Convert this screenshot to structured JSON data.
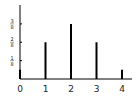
{
  "chart_data": {
    "type": "bar",
    "subtype": "stem",
    "title": "",
    "xlabel": "",
    "ylabel": "",
    "categories": [
      "0",
      "1",
      "2",
      "3",
      "4"
    ],
    "x": [
      0,
      1,
      2,
      3,
      4
    ],
    "values": [
      0.0625,
      0.25,
      0.375,
      0.25,
      0.0625
    ],
    "x_tick_labels": [
      "0",
      "1",
      "2",
      "3",
      "4"
    ],
    "y_ticks": [
      0.125,
      0.25,
      0.375
    ],
    "y_tick_labels": [
      {
        "num": "1",
        "den": "8"
      },
      {
        "num": "2",
        "den": "8"
      },
      {
        "num": "3",
        "den": "8"
      }
    ],
    "xlim": [
      0,
      4.3
    ],
    "ylim": [
      0,
      0.5
    ],
    "grid": false,
    "legend": null,
    "colors": {
      "bar": "#000000",
      "axis": "#000000",
      "tick_text": "#222222"
    }
  }
}
